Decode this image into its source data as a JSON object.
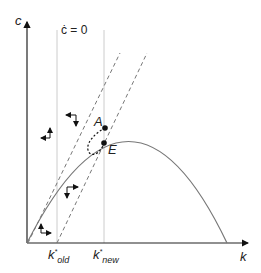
{
  "diagram": {
    "type": "phase-diagram",
    "axes": {
      "y_label": "c",
      "x_label": "k"
    },
    "isocline_label": "ċ = 0",
    "points": [
      {
        "label": "A"
      },
      {
        "label": "E"
      }
    ],
    "ticks": [
      {
        "label": "k",
        "sub": "old",
        "sup": "*"
      },
      {
        "label": "k",
        "sub": "new",
        "sup": "*"
      }
    ],
    "colors": {
      "axis": "#222222",
      "curve": "#777777",
      "vertical": "#cccccc",
      "dashed": "#777777",
      "path": "#111111"
    }
  }
}
